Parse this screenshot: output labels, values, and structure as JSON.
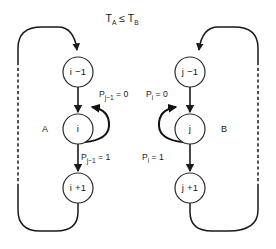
{
  "figure": {
    "title_parts": {
      "lhs_base": "T",
      "lhs_sub": "A",
      "relation": "≤",
      "rhs_base": "T",
      "rhs_sub": "B"
    }
  },
  "regions": [
    {
      "id": "A",
      "label": "A",
      "side": "left"
    },
    {
      "id": "B",
      "label": "B",
      "side": "right"
    }
  ],
  "nodes": [
    {
      "id": "a-top",
      "label": "i −1",
      "region": "A",
      "cx": 78,
      "cy": 72,
      "r": 15
    },
    {
      "id": "a-mid",
      "label": "i",
      "region": "A",
      "cx": 78,
      "cy": 129,
      "r": 15
    },
    {
      "id": "a-bottom",
      "label": "i +1",
      "region": "A",
      "cx": 78,
      "cy": 188,
      "r": 15
    },
    {
      "id": "b-top",
      "label": "j −1",
      "region": "B",
      "cx": 190,
      "cy": 72,
      "r": 15
    },
    {
      "id": "b-mid",
      "label": "j",
      "region": "B",
      "cx": 190,
      "cy": 129,
      "r": 15
    },
    {
      "id": "b-bottom",
      "label": "j +1",
      "region": "B",
      "cx": 190,
      "cy": 188,
      "r": 15
    }
  ],
  "edge_labels": [
    {
      "id": "a-selfloop-label",
      "base": "P",
      "sub": "j−1",
      "value": "= 0",
      "region": "A",
      "x": 99,
      "y": 97
    },
    {
      "id": "a-down-label",
      "base": "P",
      "sub": "j−1",
      "value": "= 1",
      "region": "A",
      "x": 81,
      "y": 160
    },
    {
      "id": "b-selfloop-label",
      "base": "P",
      "sub": "i",
      "value": "= 0",
      "region": "B",
      "x": 146,
      "y": 97
    },
    {
      "id": "b-down-label",
      "base": "P",
      "sub": "i",
      "value": "= 1",
      "region": "B",
      "x": 142,
      "y": 160
    }
  ],
  "colors": {
    "stroke": "#1a1a1a",
    "node_fill": "#ffffff",
    "background": "#ffffff"
  }
}
